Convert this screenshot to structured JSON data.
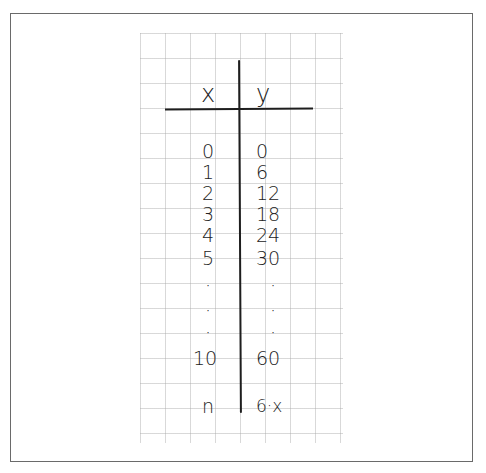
{
  "table": {
    "headers": {
      "x": "x",
      "y": "y"
    },
    "rows": [
      {
        "x": "0",
        "y": "0"
      },
      {
        "x": "1",
        "y": "6"
      },
      {
        "x": "2",
        "y": "12"
      },
      {
        "x": "3",
        "y": "18"
      },
      {
        "x": "4",
        "y": "24"
      },
      {
        "x": "5",
        "y": "30"
      },
      {
        "x": "·",
        "y": "·"
      },
      {
        "x": "·",
        "y": "·"
      },
      {
        "x": "10",
        "y": "60"
      },
      {
        "x": "n",
        "y": "6·x"
      }
    ]
  },
  "colors": {
    "ink": "#222222",
    "grid": "#aaaaaa",
    "border": "#6a6a6a"
  }
}
